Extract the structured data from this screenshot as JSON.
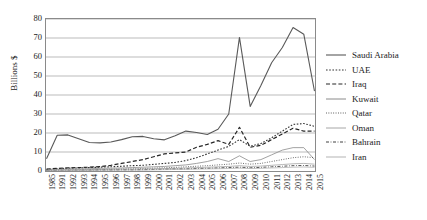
{
  "chart_data": {
    "type": "line",
    "title": "",
    "xlabel": "",
    "ylabel": "Billions $",
    "ylim": [
      0,
      80
    ],
    "ytick_values": [
      0,
      10,
      20,
      30,
      40,
      50,
      60,
      70,
      80
    ],
    "grid": true,
    "legend_position": "right",
    "categories": [
      "1985",
      "1991",
      "1992",
      "1993",
      "1994",
      "1995",
      "1996",
      "1997",
      "1998",
      "1999",
      "2000",
      "2001",
      "2002",
      "2003",
      "2004",
      "2005",
      "2006",
      "2007",
      "2008",
      "2009",
      "2010",
      "2011",
      "2012",
      "2013",
      "2014",
      "2015"
    ],
    "series": [
      {
        "name": "Saudi Arabia",
        "style": "solid",
        "color": "#595959",
        "width": 1.1,
        "values": [
          6.5,
          18.8,
          19.0,
          17.0,
          15.0,
          14.8,
          15.3,
          16.5,
          18.0,
          18.2,
          17.0,
          16.4,
          18.5,
          21.0,
          20.3,
          19.2,
          22.0,
          30.0,
          70.3,
          34.0,
          45.0,
          57.0,
          65.0,
          75.5,
          72.0,
          42.0
        ]
      },
      {
        "name": "UAE",
        "style": "dotted",
        "color": "#333333",
        "width": 1.1,
        "values": [
          0.8,
          1.2,
          1.5,
          1.6,
          1.8,
          2.0,
          2.2,
          2.5,
          2.8,
          3.0,
          3.5,
          4.0,
          4.5,
          5.5,
          7.0,
          9.0,
          11.0,
          13.0,
          16.5,
          13.0,
          14.5,
          17.5,
          21.0,
          24.5,
          25.0,
          23.5
        ]
      },
      {
        "name": "Iraq",
        "style": "dashed",
        "color": "#262626",
        "width": 1.2,
        "values": [
          1.0,
          1.4,
          1.6,
          1.8,
          2.0,
          2.3,
          3.0,
          4.0,
          5.0,
          6.0,
          7.5,
          9.0,
          9.5,
          10.0,
          12.5,
          14.0,
          16.0,
          14.0,
          23.0,
          12.5,
          13.5,
          16.5,
          19.5,
          22.5,
          21.0,
          21.0
        ]
      },
      {
        "name": "Kuwait",
        "style": "solid",
        "color": "#8a8a8a",
        "width": 0.8,
        "values": [
          0.5,
          0.8,
          1.0,
          1.1,
          1.2,
          1.4,
          1.5,
          1.6,
          1.8,
          2.0,
          2.2,
          2.4,
          2.8,
          3.2,
          4.0,
          5.0,
          6.5,
          5.0,
          8.0,
          5.0,
          6.0,
          8.5,
          11.0,
          12.3,
          12.3,
          6.0
        ]
      },
      {
        "name": "Qatar",
        "style": "fine-dotted",
        "color": "#4d4d4d",
        "width": 0.9,
        "values": [
          0.3,
          0.4,
          0.5,
          0.6,
          0.7,
          0.8,
          0.9,
          1.0,
          1.1,
          1.3,
          1.5,
          1.7,
          1.9,
          2.2,
          2.5,
          2.8,
          3.2,
          3.6,
          4.2,
          3.6,
          4.0,
          5.0,
          6.0,
          7.0,
          7.5,
          7.0
        ]
      },
      {
        "name": "Oman",
        "style": "solid-light",
        "color": "#a6a6a6",
        "width": 0.8,
        "values": [
          0.3,
          0.5,
          0.6,
          0.6,
          0.7,
          0.8,
          0.9,
          1.0,
          1.0,
          1.1,
          1.2,
          1.3,
          1.4,
          1.6,
          1.8,
          2.0,
          2.2,
          2.4,
          2.8,
          2.4,
          2.6,
          3.0,
          3.4,
          3.8,
          4.0,
          3.6
        ]
      },
      {
        "name": "Bahrain",
        "style": "dash-dot",
        "color": "#404040",
        "width": 0.9,
        "values": [
          0.2,
          0.3,
          0.3,
          0.4,
          0.4,
          0.5,
          0.5,
          0.6,
          0.6,
          0.7,
          0.8,
          0.9,
          1.0,
          1.1,
          1.3,
          1.4,
          1.6,
          1.8,
          2.0,
          1.7,
          1.9,
          2.2,
          2.5,
          2.8,
          2.9,
          2.6
        ]
      },
      {
        "name": "Iran",
        "style": "solid-lightest",
        "color": "#b3b3b3",
        "width": 0.8,
        "values": [
          0.2,
          0.2,
          0.3,
          0.3,
          0.3,
          0.4,
          0.4,
          0.5,
          0.5,
          0.5,
          0.6,
          0.7,
          0.8,
          0.9,
          1.0,
          1.1,
          1.2,
          1.3,
          1.5,
          1.3,
          1.4,
          1.6,
          1.8,
          2.0,
          2.1,
          1.9
        ]
      }
    ]
  }
}
